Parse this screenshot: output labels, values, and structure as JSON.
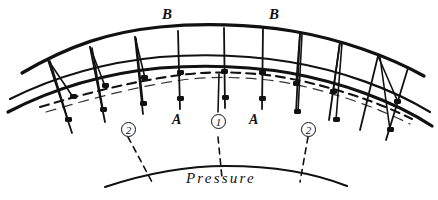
{
  "figure": {
    "kind": "hand-drawn-engineering-diagram",
    "background_color": "#ffffff",
    "ink_color": "#111111",
    "width": 438,
    "height": 200
  },
  "labels": {
    "voussoir_left": "B",
    "voussoir_right": "B",
    "springing_left": "A",
    "springing_right": "A",
    "crown_marker": "1",
    "haunch_marker_left": "2",
    "haunch_marker_right": "2",
    "pressure": "Pressure"
  },
  "annotations": [
    {
      "name": "label-B-left",
      "text": "B",
      "x": 165,
      "y": 10,
      "style": "italic-serif"
    },
    {
      "name": "label-B-right",
      "text": "B",
      "x": 272,
      "y": 10,
      "style": "italic-serif"
    },
    {
      "name": "label-A-left",
      "text": "A",
      "x": 173,
      "y": 114,
      "style": "italic-serif"
    },
    {
      "name": "label-A-right",
      "text": "A",
      "x": 250,
      "y": 114,
      "style": "italic-serif"
    },
    {
      "name": "marker-1-crown",
      "text": "1",
      "x": 211,
      "y": 115,
      "circled": true
    },
    {
      "name": "marker-2-left-haunch",
      "text": "2",
      "x": 121,
      "y": 121,
      "circled": true
    },
    {
      "name": "marker-2-right-haunch",
      "text": "2",
      "x": 301,
      "y": 121,
      "circled": true
    },
    {
      "name": "label-pressure",
      "text": "Pressure",
      "x": 186,
      "y": 172,
      "style": "italic-serif-spaced"
    }
  ],
  "geometry": {
    "extrados": {
      "description": "outer arc of arch ring",
      "stroke": "#111111",
      "width": 3
    },
    "intrados": {
      "description": "inner arc of arch ring",
      "stroke": "#111111",
      "width": 3
    },
    "soffit_lower": {
      "description": "lower boundary arc below ring",
      "stroke": "#111111",
      "width": 3
    },
    "thrust_line": {
      "description": "dashed line of pressure / line of thrust",
      "stroke": "#111111",
      "width": 2,
      "dash": "9 6"
    },
    "pressure_arc": {
      "description": "arc beneath arch annotated Pressure",
      "stroke": "#111111",
      "width": 2
    },
    "joints": {
      "count": 10,
      "description": "radial joint lines across arch ring",
      "stroke": "#111111",
      "width": 1.8
    },
    "thrust_wedges": {
      "count": 6,
      "description": "paired diagonals converging on thrust line nodes",
      "stroke": "#111111",
      "width": 1.6
    },
    "leaders": {
      "count": 3,
      "description": "dashed leader lines from markers down to pressure arc",
      "stroke": "#111111",
      "width": 1.6,
      "dash": "6 5"
    },
    "nodes": {
      "count": 16,
      "description": "filled dots at thrust and joint intersections",
      "fill": "#111111"
    }
  }
}
